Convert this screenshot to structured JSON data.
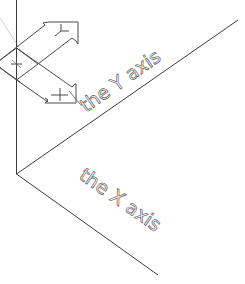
{
  "diagram": {
    "background": "#ffffff",
    "line_color": "#3a3a3a",
    "faint_line_color": "#c8c8c8",
    "axes": {
      "origin": [
        16,
        174
      ],
      "vertical_axis": {
        "from": [
          16,
          0
        ],
        "to": [
          16,
          174
        ]
      },
      "x_axis": {
        "from": [
          16,
          174
        ],
        "to": [
          158,
          275
        ]
      },
      "y_axis": {
        "from": [
          16,
          174
        ],
        "to": [
          238,
          20
        ]
      }
    },
    "labels": {
      "y_axis_label": "the Y axis",
      "x_axis_label": "the X axis"
    },
    "ucs_icon": {
      "center": [
        16,
        64
      ],
      "y_glyph": "Y",
      "x_glyph": "+",
      "origin_glyph": "+"
    }
  }
}
